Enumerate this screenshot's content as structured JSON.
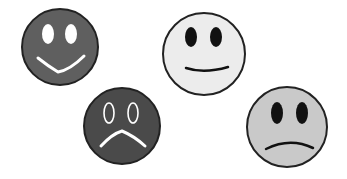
{
  "canvas": {
    "width": 347,
    "height": 179,
    "background": "#ffffff"
  },
  "faces": [
    {
      "name": "happy-dark-face",
      "expression": "happy",
      "fill": "#5f5f5f",
      "feature_color": "#ffffff",
      "eyes_style": "filled",
      "cx": 60,
      "cy": 47,
      "r": 39
    },
    {
      "name": "neutral-light-face",
      "expression": "slight-smile",
      "fill": "#ececec",
      "feature_color": "#111111",
      "eyes_style": "filled",
      "cx": 204,
      "cy": 54,
      "r": 42
    },
    {
      "name": "sad-dark-face",
      "expression": "sad",
      "fill": "#4a4a4a",
      "feature_color": "#ffffff",
      "eyes_style": "outline",
      "cx": 122,
      "cy": 126,
      "r": 39
    },
    {
      "name": "sad-gray-face",
      "expression": "slight-frown",
      "fill": "#c9c9c9",
      "feature_color": "#111111",
      "eyes_style": "filled",
      "cx": 287,
      "cy": 127,
      "r": 41
    }
  ]
}
